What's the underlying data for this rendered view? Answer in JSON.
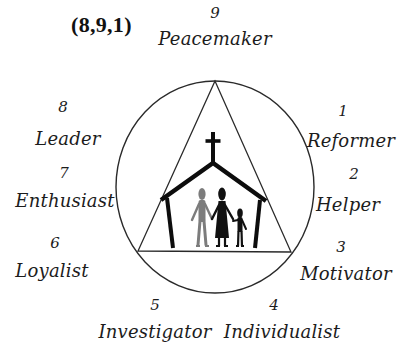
{
  "title": "(8,9,1)",
  "diagram": {
    "type": "enneagram-church",
    "colors": {
      "line": "#2a2a2a",
      "church": "#0d0d0d",
      "figure_grey": "#7a7a7a",
      "figure_black": "#111111",
      "background": "#ffffff"
    },
    "center_icon": "church-with-family-icon",
    "types": [
      {
        "number": "9",
        "name": "Peacemaker"
      },
      {
        "number": "1",
        "name": "Reformer"
      },
      {
        "number": "2",
        "name": "Helper"
      },
      {
        "number": "3",
        "name": "Motivator"
      },
      {
        "number": "4",
        "name": "Individualist"
      },
      {
        "number": "5",
        "name": "Investigator"
      },
      {
        "number": "6",
        "name": "Loyalist"
      },
      {
        "number": "7",
        "name": "Enthusiast"
      },
      {
        "number": "8",
        "name": "Leader"
      }
    ]
  }
}
